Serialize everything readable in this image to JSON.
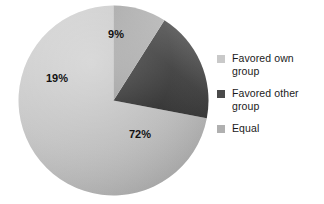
{
  "chart_data": {
    "type": "pie",
    "title": "",
    "subtitle": "",
    "xlabel": "",
    "ylabel": "",
    "grid": false,
    "legend_position": "right",
    "start_angle_deg": 0,
    "direction": "counterclockwise",
    "categories": [
      "Favored own group",
      "Favored other group",
      "Equal"
    ],
    "values": [
      72,
      19,
      9
    ],
    "value_unit": "%",
    "data_labels": [
      "72%",
      "19%",
      "9%"
    ],
    "colors": [
      "#c3c3c3",
      "#3a3a3a",
      "#a8a8a8"
    ],
    "slices": [
      {
        "label": "Favored own group",
        "value": 72,
        "data_label": "72%",
        "color": "#c3c3c3",
        "start_deg": 0,
        "end_deg": 259.2
      },
      {
        "label": "Favored other group",
        "value": 19,
        "data_label": "19%",
        "color": "#3a3a3a",
        "start_deg": 259.2,
        "end_deg": 327.6
      },
      {
        "label": "Equal",
        "value": 9,
        "data_label": "9%",
        "color": "#a8a8a8",
        "start_deg": 327.6,
        "end_deg": 360
      }
    ]
  },
  "pie": {
    "label_72": "72%",
    "label_19": "19%",
    "label_9": "9%"
  },
  "legend": {
    "items": [
      {
        "label": "Favored own\ngroup",
        "color": "#c9c9c9",
        "swatch_name": "legend-swatch-favored-own-group"
      },
      {
        "label": "Favored other\ngroup",
        "color": "#4a4a4a",
        "swatch_name": "legend-swatch-favored-other-group"
      },
      {
        "label": "Equal",
        "color": "#b0b0b0",
        "swatch_name": "legend-swatch-equal"
      }
    ]
  }
}
